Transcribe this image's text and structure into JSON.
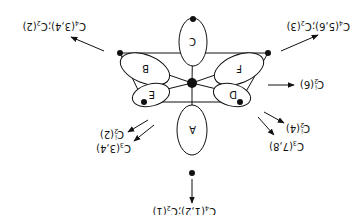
{
  "diagram": {
    "orientation": "rotated 180 degrees",
    "nodes": [
      {
        "id": "A",
        "label": "A"
      },
      {
        "id": "B",
        "label": "B"
      },
      {
        "id": "C",
        "label": "C"
      },
      {
        "id": "D",
        "label": "D"
      },
      {
        "id": "E",
        "label": "E"
      },
      {
        "id": "F",
        "label": "F"
      }
    ],
    "arrows": [
      {
        "id": "a1",
        "main": "C",
        "sub1": "4",
        "args1": "(1,2);",
        "c2": "C",
        "sub2": "2",
        "args2": "(1)"
      },
      {
        "id": "a2",
        "main": "C",
        "sub1": "4",
        "args1": "(3,4);",
        "c2": "C",
        "sub2": "2",
        "args2": "(2)"
      },
      {
        "id": "a3",
        "main": "C",
        "sub1": "4",
        "args1": "(5,6);",
        "c2": "C",
        "sub2": "2",
        "args2": "(3)"
      },
      {
        "id": "a4",
        "main": "C",
        "sub1": "2",
        "sup1": "i",
        "args1": "(6)"
      },
      {
        "id": "a5",
        "main": "C",
        "sub1": "2",
        "sup1": "i",
        "args1": "(4)"
      },
      {
        "id": "a6",
        "main": "C",
        "sub1": "3",
        "args1": "(7,8)"
      },
      {
        "id": "a7",
        "main": "C",
        "sub1": "2",
        "sup1": "i",
        "args1": "(2)"
      },
      {
        "id": "a8",
        "main": "C",
        "sub1": "3",
        "args1": "(3,4)"
      }
    ]
  }
}
